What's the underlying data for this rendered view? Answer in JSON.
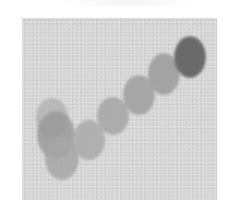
{
  "image": {
    "description": "Grayscale micrograph-style image of a chain of overlapping circular blobs on a noisy gray background",
    "panel": {
      "left": 22,
      "top": 18,
      "width": 195,
      "height": 182,
      "background": "#d6d6d6"
    },
    "blobs": [
      {
        "name": "blob-cluster-top",
        "cx": 52,
        "cy": 118,
        "rx": 16,
        "ry": 20,
        "color": "#b4b4b4",
        "opacity": 0.85
      },
      {
        "name": "blob-cluster-middle",
        "cx": 56,
        "cy": 135,
        "rx": 19,
        "ry": 24,
        "color": "#9a9a9a",
        "opacity": 0.85
      },
      {
        "name": "blob-cluster-bottom",
        "cx": 62,
        "cy": 158,
        "rx": 17,
        "ry": 22,
        "color": "#a6a6a6",
        "opacity": 0.85
      },
      {
        "name": "blob-chain-1",
        "cx": 89,
        "cy": 140,
        "rx": 16,
        "ry": 20,
        "color": "#acacac",
        "opacity": 0.9
      },
      {
        "name": "blob-chain-2",
        "cx": 113,
        "cy": 116,
        "rx": 16,
        "ry": 19,
        "color": "#a8a8a8",
        "opacity": 0.9
      },
      {
        "name": "blob-chain-3",
        "cx": 139,
        "cy": 95,
        "rx": 16,
        "ry": 20,
        "color": "#a2a2a2",
        "opacity": 0.9
      },
      {
        "name": "blob-chain-4",
        "cx": 164,
        "cy": 74,
        "rx": 16,
        "ry": 21,
        "color": "#9e9e9e",
        "opacity": 0.9
      },
      {
        "name": "blob-dark-end",
        "cx": 190,
        "cy": 57,
        "rx": 16,
        "ry": 21,
        "color": "#6a6a6a",
        "opacity": 1.0
      }
    ]
  }
}
